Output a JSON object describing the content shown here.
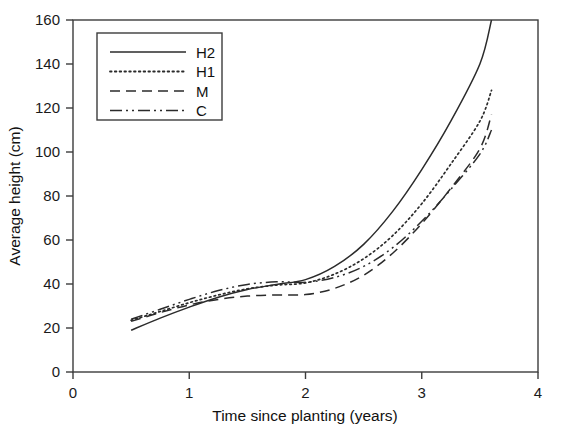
{
  "chart_data": {
    "type": "line",
    "title": "",
    "xlabel": "Time since planting (years)",
    "ylabel": "Average height (cm)",
    "xlim": [
      0,
      4
    ],
    "ylim": [
      0,
      160
    ],
    "xticks": [
      "0",
      "1",
      "2",
      "3",
      "4"
    ],
    "xtick_values": [
      0,
      1,
      2,
      3,
      4
    ],
    "yticks": [
      "0",
      "20",
      "40",
      "60",
      "80",
      "100",
      "120",
      "140",
      "160"
    ],
    "ytick_values": [
      0,
      20,
      40,
      60,
      80,
      100,
      120,
      140,
      160
    ],
    "grid": false,
    "legend_position": "upper-left-inside",
    "x": [
      0.5,
      0.75,
      1.0,
      1.25,
      1.5,
      1.75,
      2.0,
      2.25,
      2.5,
      2.75,
      3.0,
      3.25,
      3.5,
      3.6
    ],
    "series": [
      {
        "name": "H2",
        "label": "H2",
        "style": "solid",
        "dasharray": "",
        "values": [
          19.0,
          24.5,
          29.5,
          34.0,
          37.5,
          39.8,
          42.0,
          48.0,
          58.0,
          73.0,
          92.0,
          114.0,
          140.0,
          160.0
        ]
      },
      {
        "name": "H1",
        "label": "H1",
        "style": "dotted",
        "dasharray": "1.6,3.2",
        "values": [
          23.5,
          27.5,
          31.5,
          35.0,
          37.8,
          39.5,
          40.5,
          44.5,
          51.5,
          62.0,
          76.5,
          94.5,
          114.0,
          128.0
        ]
      },
      {
        "name": "M",
        "label": "M",
        "style": "dashed",
        "dasharray": "10,6",
        "values": [
          23.0,
          27.0,
          30.5,
          33.0,
          34.5,
          35.0,
          35.2,
          38.0,
          44.0,
          54.0,
          67.5,
          83.5,
          101.5,
          117.0
        ]
      },
      {
        "name": "C",
        "label": "C",
        "style": "dash-dot-dot",
        "dasharray": "12,4,2,4,2,4",
        "values": [
          24.0,
          28.5,
          33.0,
          37.0,
          39.8,
          41.0,
          40.8,
          43.0,
          48.0,
          56.5,
          68.5,
          83.0,
          99.0,
          110.0
        ]
      }
    ]
  },
  "axes": {
    "x_title": "Time since planting (years)",
    "y_title": "Average height (cm)"
  },
  "legend": {
    "entries": [
      {
        "label": "H2"
      },
      {
        "label": "H1"
      },
      {
        "label": "M"
      },
      {
        "label": "C"
      }
    ]
  }
}
